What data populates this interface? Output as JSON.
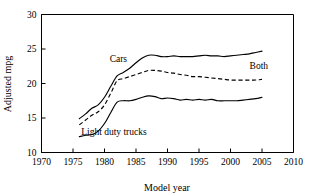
{
  "chart_data": {
    "type": "line",
    "title": "",
    "xlabel": "Model year",
    "ylabel": "Adjusted mpg",
    "xlim": [
      1970,
      2010
    ],
    "ylim": [
      10,
      30
    ],
    "xticks": [
      1970,
      1975,
      1980,
      1985,
      1990,
      1995,
      2000,
      2005,
      2010
    ],
    "yticks": [
      10,
      15,
      20,
      25,
      30
    ],
    "grid": false,
    "legend_position": "inline-annotations",
    "series": [
      {
        "name": "Cars",
        "style": "solid",
        "label_x": 1982.2,
        "label_y": 23.1,
        "x": [
          1976,
          1977,
          1978,
          1979,
          1980,
          1981,
          1982,
          1983,
          1984,
          1985,
          1986,
          1987,
          1988,
          1989,
          1990,
          1991,
          1992,
          1993,
          1994,
          1995,
          1996,
          1997,
          1998,
          1999,
          2000,
          2001,
          2002,
          2003,
          2004,
          2005
        ],
        "y": [
          14.9,
          15.6,
          16.4,
          16.9,
          18.0,
          19.6,
          21.1,
          21.6,
          22.2,
          23.0,
          23.7,
          24.1,
          24.1,
          23.9,
          23.9,
          24.0,
          23.9,
          23.9,
          23.9,
          24.0,
          24.1,
          24.0,
          24.0,
          23.9,
          24.0,
          24.1,
          24.2,
          24.3,
          24.5,
          24.7
        ]
      },
      {
        "name": "Both",
        "style": "dashed",
        "label_x": 2004.5,
        "label_y": 22.1,
        "x": [
          1976,
          1977,
          1978,
          1979,
          1980,
          1981,
          1982,
          1983,
          1984,
          1985,
          1986,
          1987,
          1988,
          1989,
          1990,
          1991,
          1992,
          1993,
          1994,
          1995,
          1996,
          1997,
          1998,
          1999,
          2000,
          2001,
          2002,
          2003,
          2004,
          2005
        ],
        "y": [
          14.0,
          14.7,
          15.4,
          15.9,
          16.9,
          18.6,
          20.4,
          20.7,
          21.0,
          21.3,
          21.6,
          21.9,
          21.9,
          21.8,
          21.6,
          21.5,
          21.3,
          21.2,
          21.0,
          21.0,
          20.9,
          20.8,
          20.7,
          20.6,
          20.5,
          20.5,
          20.5,
          20.5,
          20.5,
          20.6
        ]
      },
      {
        "name": "Light duty trucks",
        "style": "solid",
        "label_x": 1981.5,
        "label_y": 12.6,
        "x": [
          1976,
          1977,
          1978,
          1979,
          1980,
          1981,
          1982,
          1983,
          1984,
          1985,
          1986,
          1987,
          1988,
          1989,
          1990,
          1991,
          1992,
          1993,
          1994,
          1995,
          1996,
          1997,
          1998,
          1999,
          2000,
          2001,
          2002,
          2003,
          2004,
          2005
        ],
        "y": [
          12.3,
          12.5,
          12.6,
          13.1,
          14.2,
          15.8,
          17.3,
          17.5,
          17.5,
          17.7,
          18.0,
          18.2,
          18.1,
          17.8,
          17.9,
          17.8,
          17.6,
          17.7,
          17.6,
          17.7,
          17.6,
          17.7,
          17.5,
          17.5,
          17.5,
          17.5,
          17.6,
          17.7,
          17.8,
          18.0
        ]
      }
    ]
  },
  "axes": {
    "y_label": "Adjusted mpg",
    "x_label": "Model year",
    "x_tick_labels": [
      "1970",
      "1975",
      "1980",
      "1985",
      "1990",
      "1995",
      "2000",
      "2005",
      "2010"
    ],
    "y_tick_labels": [
      "10",
      "15",
      "20",
      "25",
      "30"
    ]
  },
  "annotations": {
    "cars": "Cars",
    "both": "Both",
    "trucks": "Light duty trucks"
  },
  "colors": {
    "line": "#000000",
    "background": "#ffffff",
    "axis": "#000000"
  }
}
